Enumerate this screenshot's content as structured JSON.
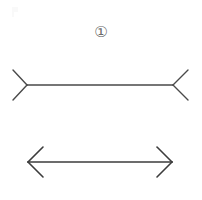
{
  "figure": {
    "label": "①",
    "label_icon_name": "circled-digit-one",
    "background_color": "#ffffff",
    "stroke_color": "#4a4a4a",
    "stroke_color_bottom": "#3c3c3c",
    "label_color": "#6b6b6b",
    "illusion_name": "Müller-Lyer illusion",
    "shafts": [
      {
        "name": "top-shaft",
        "x1": 27,
        "y1": 85,
        "x2": 173,
        "y2": 85,
        "length_px": 146,
        "end_style": "fins-out",
        "stroke_width": 1.4
      },
      {
        "name": "bottom-shaft",
        "x1": 28,
        "y1": 162,
        "x2": 172,
        "y2": 162,
        "length_px": 144,
        "end_style": "arrowheads-in",
        "stroke_width": 1.6
      }
    ],
    "fins": [
      {
        "name": "top-left-fin",
        "vertex_x": 27,
        "vertex_y": 85,
        "tip_upper_x": 13,
        "tip_upper_y": 70,
        "tip_lower_x": 13,
        "tip_lower_y": 100,
        "direction": "opens-left"
      },
      {
        "name": "top-right-fin",
        "vertex_x": 173,
        "vertex_y": 85,
        "tip_upper_x": 188,
        "tip_upper_y": 70,
        "tip_lower_x": 188,
        "tip_lower_y": 100,
        "direction": "opens-right"
      },
      {
        "name": "bottom-left-arrowhead",
        "vertex_x": 28,
        "vertex_y": 162,
        "tip_upper_x": 43,
        "tip_upper_y": 147,
        "tip_lower_x": 43,
        "tip_lower_y": 177,
        "direction": "opens-right"
      },
      {
        "name": "bottom-right-arrowhead",
        "vertex_x": 172,
        "vertex_y": 162,
        "tip_upper_x": 157,
        "tip_upper_y": 147,
        "tip_lower_x": 157,
        "tip_lower_y": 177,
        "direction": "opens-left"
      }
    ]
  }
}
